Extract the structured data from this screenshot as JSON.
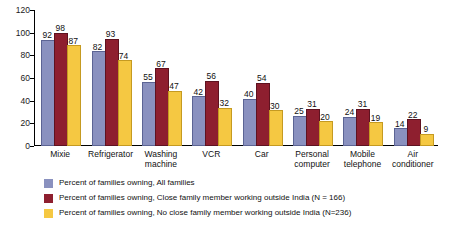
{
  "chart_data": {
    "type": "bar",
    "title": "",
    "xlabel": "",
    "ylabel": "",
    "ylim": [
      0,
      120
    ],
    "yticks": [
      0,
      20,
      40,
      60,
      80,
      100,
      120
    ],
    "grid": false,
    "legend_position": "bottom-left",
    "categories": [
      "Mixie",
      "Refrigerator",
      "Washing machine",
      "VCR",
      "Car",
      "Personal computer",
      "Mobile telephone",
      "Air conditioner"
    ],
    "category_lines": [
      [
        "Mixie"
      ],
      [
        "Refrigerator"
      ],
      [
        "Washing",
        "machine"
      ],
      [
        "VCR"
      ],
      [
        "Car"
      ],
      [
        "Personal",
        "computer"
      ],
      [
        "Mobile",
        "telephone"
      ],
      [
        "Air",
        "conditioner"
      ]
    ],
    "series": [
      {
        "name": "Percent of families owning, All families",
        "color": "#8a91bf",
        "values": [
          92,
          82,
          55,
          42,
          40,
          25,
          24,
          14
        ]
      },
      {
        "name": "Percent of families owning, Close family member working outside India (N = 166)",
        "color": "#8e1f2f",
        "values": [
          98,
          93,
          67,
          56,
          54,
          31,
          31,
          22
        ]
      },
      {
        "name": "Percent of families owning, No close family member working  outside India (N=236)",
        "color": "#f5c842",
        "values": [
          87,
          74,
          47,
          32,
          30,
          20,
          19,
          9
        ]
      }
    ]
  },
  "legend": [
    {
      "label": "Percent of families owning, All families",
      "color": "#8a91bf"
    },
    {
      "label": "Percent of families owning, Close family member working outside India (N = 166)",
      "color": "#8e1f2f"
    },
    {
      "label": "Percent of families owning, No close family member working  outside India (N=236)",
      "color": "#f5c842"
    }
  ]
}
